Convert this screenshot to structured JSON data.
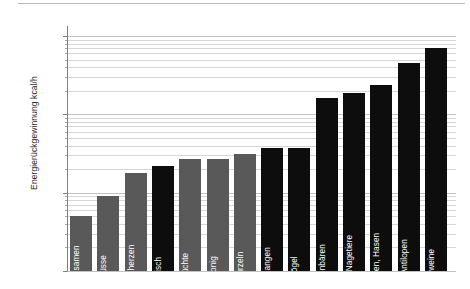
{
  "chart_data": {
    "type": "bar",
    "title": "",
    "subtitle": "",
    "xlabel": "",
    "ylabel": "Energierückgewinnung kcal/h",
    "yscale": "log",
    "ylim": [
      100,
      100000
    ],
    "ytick_labels": [
      "100",
      "1.000",
      "10.000",
      "100.000"
    ],
    "ytick_values": [
      100,
      1000,
      10000,
      100000
    ],
    "grid": "horizontal-log-minor",
    "legend": "none",
    "categories": [
      "Grassamen",
      "Nüsse",
      "Palmherzen",
      "Fisch",
      "Früchte",
      "Honig",
      "Wurzeln",
      "Schlangen",
      "Vögel",
      "Nasenbären",
      "Pakas, Nagetiere",
      "Kaninchen, Hasen",
      "Wild, Antilopen",
      "Schweine"
    ],
    "values": [
      500,
      900,
      1800,
      2200,
      2700,
      2700,
      3100,
      3700,
      3700,
      16000,
      19000,
      24000,
      45000,
      70000
    ],
    "colors": [
      "#595959",
      "#595959",
      "#595959",
      "#0d0d0d",
      "#595959",
      "#595959",
      "#595959",
      "#0d0d0d",
      "#0d0d0d",
      "#0d0d0d",
      "#0d0d0d",
      "#0d0d0d",
      "#0d0d0d",
      "#0d0d0d"
    ],
    "accent_dark": "#0d0d0d",
    "accent_grey": "#595959",
    "grid_color": "#d6d6d6",
    "axis_color": "#808080"
  }
}
